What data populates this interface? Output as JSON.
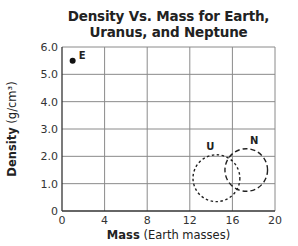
{
  "chart_data": {
    "type": "scatter",
    "title": "Density Vs. Mass for Earth, Uranus, and Neptune",
    "title_lines": [
      "Density Vs. Mass for Earth,",
      "Uranus, and Neptune"
    ],
    "xlabel": "Mass (Earth masses)",
    "xlabel_bold": "Mass",
    "xlabel_rest": " (Earth masses)",
    "ylabel": "Density (g/cm³)",
    "ylabel_bold": "Density",
    "ylabel_rest": " (g/cm³)",
    "xlim": [
      0,
      20
    ],
    "ylim": [
      0,
      6.0
    ],
    "x_ticks": [
      "0",
      "4",
      "8",
      "12",
      "16",
      "20"
    ],
    "y_ticks": [
      "0",
      "1.0",
      "2.0",
      "3.0",
      "4.0",
      "5.0",
      "6.0"
    ],
    "grid": true,
    "legend": null,
    "series": [
      {
        "name": "E",
        "planet": "Earth",
        "x": 1.0,
        "y": 5.5,
        "marker": "filled-dot"
      },
      {
        "name": "U",
        "planet": "Uranus",
        "x": 14.5,
        "y": 1.2,
        "marker": "dashed-circle",
        "radius_x_units": 2.2
      },
      {
        "name": "N",
        "planet": "Neptune",
        "x": 17.3,
        "y": 1.5,
        "marker": "dashed-circle",
        "radius_x_units": 2.0
      }
    ]
  }
}
